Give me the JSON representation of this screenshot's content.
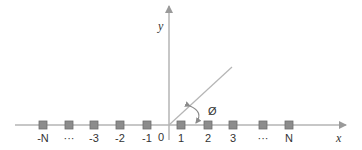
{
  "diagram": {
    "x_axis_label": "x",
    "y_axis_label": "y",
    "origin_label": "0",
    "angle_label": "Ø",
    "colors": {
      "axis": "#b5b5b5",
      "marker_fill": "#8c8c8c",
      "marker_stroke": "#6e6e6e",
      "text": "#333333"
    },
    "points": [
      {
        "label": "-N",
        "x": 43
      },
      {
        "label": "···",
        "x": 69
      },
      {
        "label": "-3",
        "x": 94
      },
      {
        "label": "-2",
        "x": 120
      },
      {
        "label": "-1",
        "x": 147
      },
      {
        "label": "1",
        "x": 181
      },
      {
        "label": "2",
        "x": 208
      },
      {
        "label": "3",
        "x": 233
      },
      {
        "label": "···",
        "x": 263
      },
      {
        "label": "N",
        "x": 289
      }
    ]
  }
}
